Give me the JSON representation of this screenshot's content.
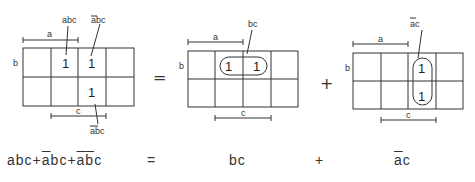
{
  "maps": [
    {
      "id": "map-original",
      "labels": {
        "a": "a",
        "b": "b",
        "c": "c"
      },
      "ones": [
        "1",
        "1",
        "1"
      ],
      "annotations": [
        {
          "text": "abc",
          "bar": ""
        },
        {
          "text": "abc",
          "bar": "a"
        },
        {
          "text": "abc",
          "bar": "ab"
        }
      ]
    },
    {
      "id": "map-bc",
      "labels": {
        "a": "a",
        "b": "b",
        "c": "c"
      },
      "ones": [
        "1",
        "1"
      ],
      "annotations": [
        {
          "text": "bc",
          "bar": ""
        }
      ],
      "loop": "horizontal"
    },
    {
      "id": "map-abar-c",
      "labels": {
        "a": "a",
        "b": "b",
        "c": "c"
      },
      "ones": [
        "1",
        "1"
      ],
      "annotations": [
        {
          "text": "ac",
          "bar": "a"
        }
      ],
      "loop": "vertical"
    }
  ],
  "operators": {
    "equals": "=",
    "plus": "+"
  },
  "equation": {
    "terms": [
      {
        "parts": [
          {
            "t": "a",
            "bar": false
          },
          {
            "t": "b",
            "bar": false
          },
          {
            "t": "c",
            "bar": false
          }
        ]
      },
      {
        "sep": "+"
      },
      {
        "parts": [
          {
            "t": "a",
            "bar": true
          },
          {
            "t": "b",
            "bar": false
          },
          {
            "t": "c",
            "bar": false
          }
        ]
      },
      {
        "sep": "+"
      },
      {
        "parts": [
          {
            "t": "a",
            "bar": true
          },
          {
            "t": "b",
            "bar": true
          },
          {
            "t": "c",
            "bar": false
          }
        ]
      }
    ],
    "lhs_text": "abc+ābc+āb̅c",
    "equals": "=",
    "rhs1": "bc",
    "plus": "+",
    "rhs2_a": "a",
    "rhs2_c": "c"
  }
}
